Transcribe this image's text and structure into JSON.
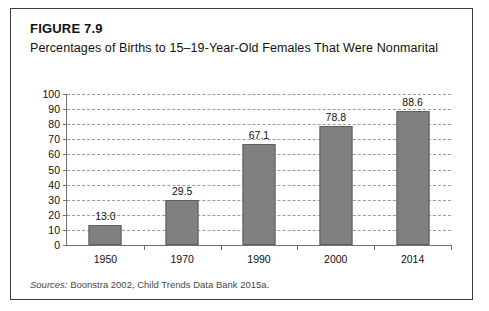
{
  "figure": {
    "number": "FIGURE 7.9",
    "title": "Percentages of Births to 15–19-Year-Old Females That Were Nonmarital",
    "source_label": "Sources:",
    "source_text": " Boonstra 2002, Child Trends Data Bank 2015a."
  },
  "colors": {
    "bar_fill": "#808080",
    "bar_stroke": "#5f5f5f",
    "axis": "#6f6f6f",
    "gridline": "#9a9a9a",
    "border": "#3b3b3b",
    "text": "#111111"
  },
  "chart_data": {
    "type": "bar",
    "title": "Percentages of Births to 15–19-Year-Old Females That Were Nonmarital",
    "xlabel": "",
    "ylabel": "",
    "categories": [
      "1950",
      "1970",
      "1990",
      "2000",
      "2014"
    ],
    "values": [
      13.0,
      29.5,
      67.1,
      78.8,
      88.6
    ],
    "data_labels": [
      "13.0",
      "29.5",
      "67.1",
      "78.8",
      "88.6"
    ],
    "ylim": [
      0,
      100
    ],
    "yticks": [
      0,
      10,
      20,
      30,
      40,
      50,
      60,
      70,
      80,
      90,
      100
    ],
    "ytick_labels": [
      "0",
      "10",
      "20",
      "30",
      "40",
      "50",
      "60",
      "70",
      "80",
      "90",
      "100"
    ],
    "grid": true,
    "grid_style": "dashed",
    "legend": false
  }
}
